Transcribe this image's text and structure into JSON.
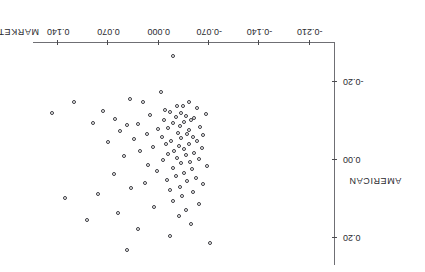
{
  "chart_data": {
    "type": "scatter",
    "title": "",
    "xlabel": "MARKET",
    "ylabel": "AMERICAN",
    "xlim": [
      -0.245,
      0.175
    ],
    "ylim": [
      -0.3,
      0.27
    ],
    "grid": false,
    "legend": "none",
    "rotation_degrees": 180,
    "marker": "open-circle",
    "xticks": [
      0.14,
      0.07,
      0.0,
      -0.07,
      -0.14,
      -0.21
    ],
    "xtick_labels": [
      "0.140",
      "0.070",
      "0.000",
      "-0.070",
      "-0.140",
      "-0.210"
    ],
    "yticks": [
      -0.2,
      0.0,
      0.2
    ],
    "ytick_labels": [
      "-0.20",
      "0.00",
      "0.20"
    ],
    "points": [
      [
        -0.018,
        -0.268
      ],
      [
        0.15,
        -0.122
      ],
      [
        -0.002,
        -0.178
      ],
      [
        0.042,
        -0.16
      ],
      [
        0.024,
        -0.151
      ],
      [
        0.119,
        -0.15
      ],
      [
        -0.04,
        -0.152
      ],
      [
        -0.024,
        -0.142
      ],
      [
        -0.032,
        -0.14
      ],
      [
        -0.052,
        -0.136
      ],
      [
        -0.007,
        -0.13
      ],
      [
        0.079,
        -0.127
      ],
      [
        -0.014,
        -0.126
      ],
      [
        -0.03,
        -0.124
      ],
      [
        -0.064,
        -0.12
      ],
      [
        0.013,
        -0.118
      ],
      [
        -0.036,
        -0.116
      ],
      [
        -0.022,
        -0.113
      ],
      [
        -0.048,
        -0.111
      ],
      [
        0.062,
        -0.108
      ],
      [
        -0.006,
        -0.105
      ],
      [
        -0.044,
        -0.104
      ],
      [
        -0.034,
        -0.101
      ],
      [
        0.093,
        -0.098
      ],
      [
        -0.019,
        -0.096
      ],
      [
        0.03,
        -0.094
      ],
      [
        0.046,
        -0.092
      ],
      [
        -0.028,
        -0.09
      ],
      [
        -0.056,
        -0.086
      ],
      [
        -0.011,
        -0.084
      ],
      [
        0.003,
        -0.082
      ],
      [
        -0.04,
        -0.078
      ],
      [
        0.055,
        -0.076
      ],
      [
        -0.025,
        -0.072
      ],
      [
        -0.038,
        -0.07
      ],
      [
        0.018,
        -0.068
      ],
      [
        -0.06,
        -0.066
      ],
      [
        -0.003,
        -0.062
      ],
      [
        -0.046,
        -0.06
      ],
      [
        -0.03,
        -0.058
      ],
      [
        0.036,
        -0.055
      ],
      [
        -0.016,
        -0.052
      ],
      [
        -0.052,
        -0.05
      ],
      [
        0.072,
        -0.048
      ],
      [
        -0.008,
        -0.044
      ],
      [
        -0.041,
        -0.042
      ],
      [
        -0.027,
        -0.038
      ],
      [
        0.01,
        -0.036
      ],
      [
        -0.058,
        -0.033
      ],
      [
        -0.034,
        -0.03
      ],
      [
        -0.02,
        -0.026
      ],
      [
        0.027,
        -0.024
      ],
      [
        -0.048,
        -0.021
      ],
      [
        -0.012,
        -0.018
      ],
      [
        -0.036,
        -0.014
      ],
      [
        0.05,
        -0.012
      ],
      [
        -0.024,
        -0.008
      ],
      [
        -0.054,
        -0.005
      ],
      [
        -0.005,
        -0.002
      ],
      [
        -0.042,
        0.002
      ],
      [
        -0.03,
        0.006
      ],
      [
        0.016,
        0.01
      ],
      [
        -0.066,
        0.014
      ],
      [
        -0.018,
        0.018
      ],
      [
        -0.045,
        0.022
      ],
      [
        0.004,
        0.026
      ],
      [
        -0.033,
        0.03
      ],
      [
        0.064,
        0.034
      ],
      [
        -0.022,
        0.038
      ],
      [
        -0.05,
        0.044
      ],
      [
        -0.01,
        0.048
      ],
      [
        -0.038,
        0.052
      ],
      [
        0.021,
        0.056
      ],
      [
        -0.06,
        0.06
      ],
      [
        -0.028,
        0.066
      ],
      [
        0.04,
        0.07
      ],
      [
        -0.014,
        0.074
      ],
      [
        -0.046,
        0.08
      ],
      [
        0.086,
        0.084
      ],
      [
        -0.031,
        0.09
      ],
      [
        0.132,
        0.096
      ],
      [
        -0.019,
        0.102
      ],
      [
        -0.055,
        0.11
      ],
      [
        0.008,
        0.118
      ],
      [
        -0.037,
        0.126
      ],
      [
        0.058,
        0.134
      ],
      [
        -0.026,
        0.142
      ],
      [
        0.101,
        0.152
      ],
      [
        -0.044,
        0.162
      ],
      [
        0.03,
        0.176
      ],
      [
        -0.014,
        0.192
      ],
      [
        -0.07,
        0.21
      ],
      [
        0.046,
        0.23
      ]
    ]
  },
  "figure": {
    "x_axis_title": "MARKET",
    "y_axis_title": "AMERICAN",
    "cropped_header_text": ""
  },
  "colors": {
    "marker_stroke": "#3a3a40",
    "axis": "#6f6f74",
    "tick": "#4a4a4f",
    "text": "#2b2b2f",
    "background": "#ffffff"
  }
}
